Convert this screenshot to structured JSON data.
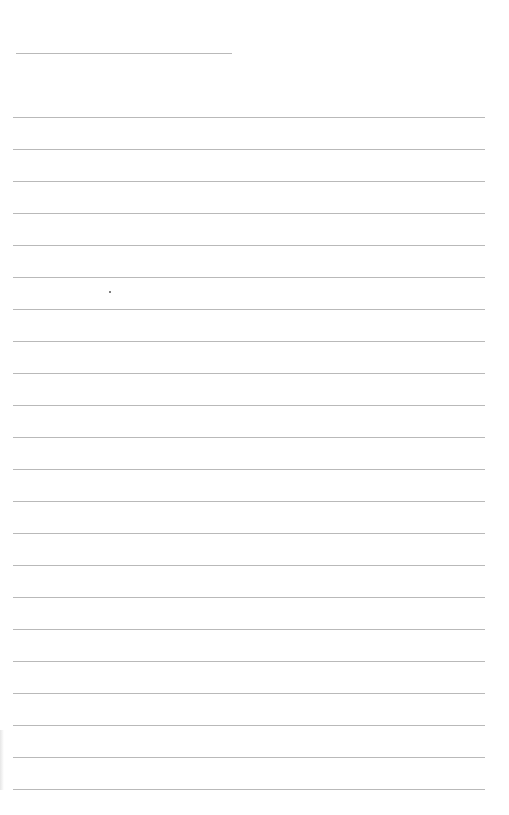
{
  "page": {
    "kind": "lined-paper",
    "title_line": {
      "x1": 16,
      "x2": 232,
      "y": 53
    },
    "ruled_lines": {
      "count": 22,
      "start_y": 117,
      "spacing": 32,
      "x1": 13,
      "x2": 485,
      "color": "#b9b9b9"
    },
    "marks": [
      {
        "type": "dot",
        "x": 110,
        "y": 292
      }
    ],
    "text": []
  }
}
